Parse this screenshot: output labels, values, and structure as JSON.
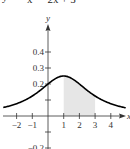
{
  "equation": {
    "lhs": "y =",
    "denominator": "x² − 2x + 5",
    "full": "y = 1 / (x² − 2x + 5)"
  },
  "chart_data": {
    "type": "line",
    "xlabel": "x",
    "ylabel": "y",
    "xlim": [
      -2.9,
      5.0
    ],
    "ylim": [
      -0.2,
      0.45
    ],
    "x_ticks": [
      -2,
      -1,
      1,
      2,
      3,
      4
    ],
    "x_tick_labels": [
      "−2",
      "−1",
      "1",
      "2",
      "3",
      "4"
    ],
    "y_ticks": [
      0.4,
      0.3,
      0.2,
      0.1,
      -0.1,
      -0.2
    ],
    "y_tick_labels": [
      "0.4",
      "0.3",
      "0.2",
      "",
      "",
      "−0.2"
    ],
    "series": [
      {
        "name": "f(x) = 1/(x² − 2x + 5)",
        "x": [
          -3,
          -2,
          -1,
          0,
          1,
          2,
          3,
          4,
          5
        ],
        "values": [
          0.05,
          0.077,
          0.125,
          0.2,
          0.25,
          0.2,
          0.125,
          0.077,
          0.05
        ]
      }
    ],
    "shaded_region": {
      "x_from": 1,
      "x_to": 3,
      "under": "curve",
      "color": "#e6e6e6"
    },
    "grid": false,
    "colors": {
      "curve": "#000000",
      "axis": "#333333",
      "shade": "#e6e6e6"
    }
  }
}
